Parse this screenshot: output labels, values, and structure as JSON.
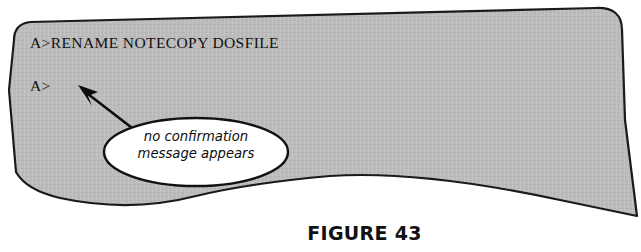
{
  "figure": {
    "caption": "FIGURE 43",
    "screen_fill_color": "#bdbdbd",
    "screen_outline_color": "#1a1a1a",
    "callout_fill_color": "#ffffff",
    "text_color": "#101010"
  },
  "terminal": {
    "lines": [
      {
        "id": "command",
        "text": "A>RENAME NOTECOPY DOSFILE"
      },
      {
        "id": "prompt",
        "text": "A>"
      }
    ]
  },
  "callout": {
    "line1": "no confirmation",
    "line2": "message appears",
    "pointer_target": "A> prompt"
  },
  "icons": {
    "arrow": "arrow-up-left-icon"
  }
}
